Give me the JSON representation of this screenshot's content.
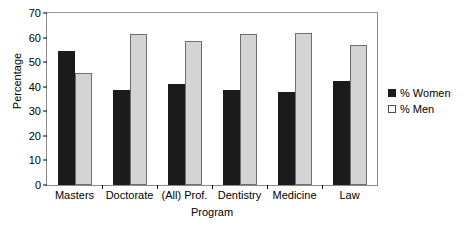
{
  "chart_data": {
    "type": "bar",
    "title": "",
    "xlabel": "Program",
    "ylabel": "Percentage",
    "categories": [
      "Masters",
      "Doctorate",
      "(All) Prof.",
      "Dentistry",
      "Medicine",
      "Law"
    ],
    "series": [
      {
        "name": "% Women",
        "color": "#1b1b1b",
        "values": [
          54.5,
          38.5,
          41.0,
          38.5,
          38.0,
          42.5
        ]
      },
      {
        "name": "% Men",
        "color": "#d4d4d4",
        "values": [
          45.5,
          61.5,
          58.5,
          61.5,
          62.0,
          57.0
        ]
      }
    ],
    "ylim": [
      0,
      70
    ],
    "ytick_step": 10,
    "yticks": [
      0,
      10,
      20,
      30,
      40,
      50,
      60,
      70
    ],
    "ytick_labels": [
      "0",
      "10",
      "20",
      "30",
      "40",
      "50",
      "60",
      "70"
    ],
    "grid": false,
    "legend_position": "right"
  },
  "legend": {
    "entries": [
      {
        "label": "% Women"
      },
      {
        "label": "% Men"
      }
    ]
  }
}
